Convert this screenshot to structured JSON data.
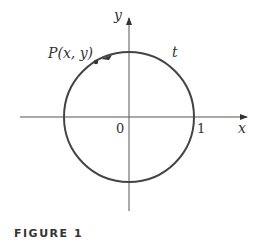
{
  "figure": {
    "caption": "FIGURE 1",
    "labels": {
      "y_axis": "y",
      "x_axis": "x",
      "origin": "0",
      "one": "1",
      "point": "P(x, y)",
      "arc": "t"
    },
    "colors": {
      "axis": "#555555",
      "circle": "#444444",
      "text": "#333333"
    }
  }
}
